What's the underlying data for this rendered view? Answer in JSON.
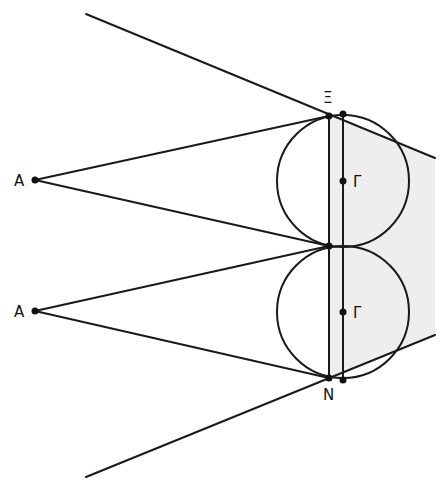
{
  "diagram": {
    "type": "geometric-construction",
    "colors": {
      "stroke": "#1a1a1a",
      "shade": "#eeeeee",
      "background": "#ffffff"
    },
    "labels": {
      "xi": "Ξ",
      "nu": "N",
      "gamma_top": "Γ",
      "gamma_bottom": "Γ",
      "a_top": "A",
      "a_bottom": "A"
    }
  }
}
